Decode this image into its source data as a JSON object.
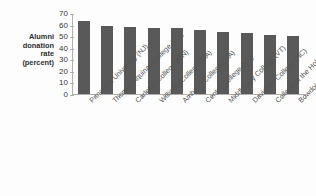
{
  "chart_data": {
    "type": "bar",
    "title": "",
    "subtitle": "",
    "xlabel": "",
    "ylabel": "Alumni donation rate (percent)",
    "ylabel_lines": [
      "Alumni",
      "donation",
      "rate",
      "(percent)"
    ],
    "ylim": [
      0,
      70
    ],
    "ytick_step": 10,
    "yticks": [
      70,
      60,
      50,
      40,
      30,
      20,
      10,
      0
    ],
    "grid": false,
    "legend": null,
    "bar_color": "#595959",
    "axis_color": "#b0b0b0",
    "categories": [
      "Princeton University (NJ)",
      "Thomas Aquinas College (CA)",
      "Carleton College (MN)",
      "Williams College (MA)",
      "Amherst College (MA)",
      "Centre College (KY)",
      "Middlebury College (VT)",
      "Davidson College (NC)",
      "College of the Holy Cross (MA)",
      "Bowdoin College (ME)"
    ],
    "values": [
      63,
      59,
      58,
      57,
      57,
      55,
      54,
      53,
      51,
      50
    ]
  }
}
